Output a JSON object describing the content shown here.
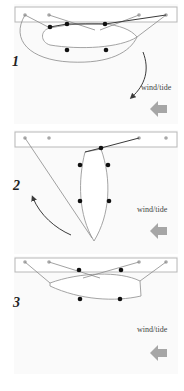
{
  "panels": [
    {
      "number": "1",
      "wind_label": "wind/tide"
    },
    {
      "number": "2",
      "wind_label": "wind/tide"
    },
    {
      "number": "3",
      "wind_label": "wind/tide"
    }
  ],
  "colors": {
    "pontoon_border": "#b8b8b8",
    "cleat": "#a8a8a8",
    "line": "#8a8a8a",
    "fender_dot": "#111111",
    "wind_arrow": "#a6a6a6",
    "turn_arrow": "#3a3a3a"
  }
}
